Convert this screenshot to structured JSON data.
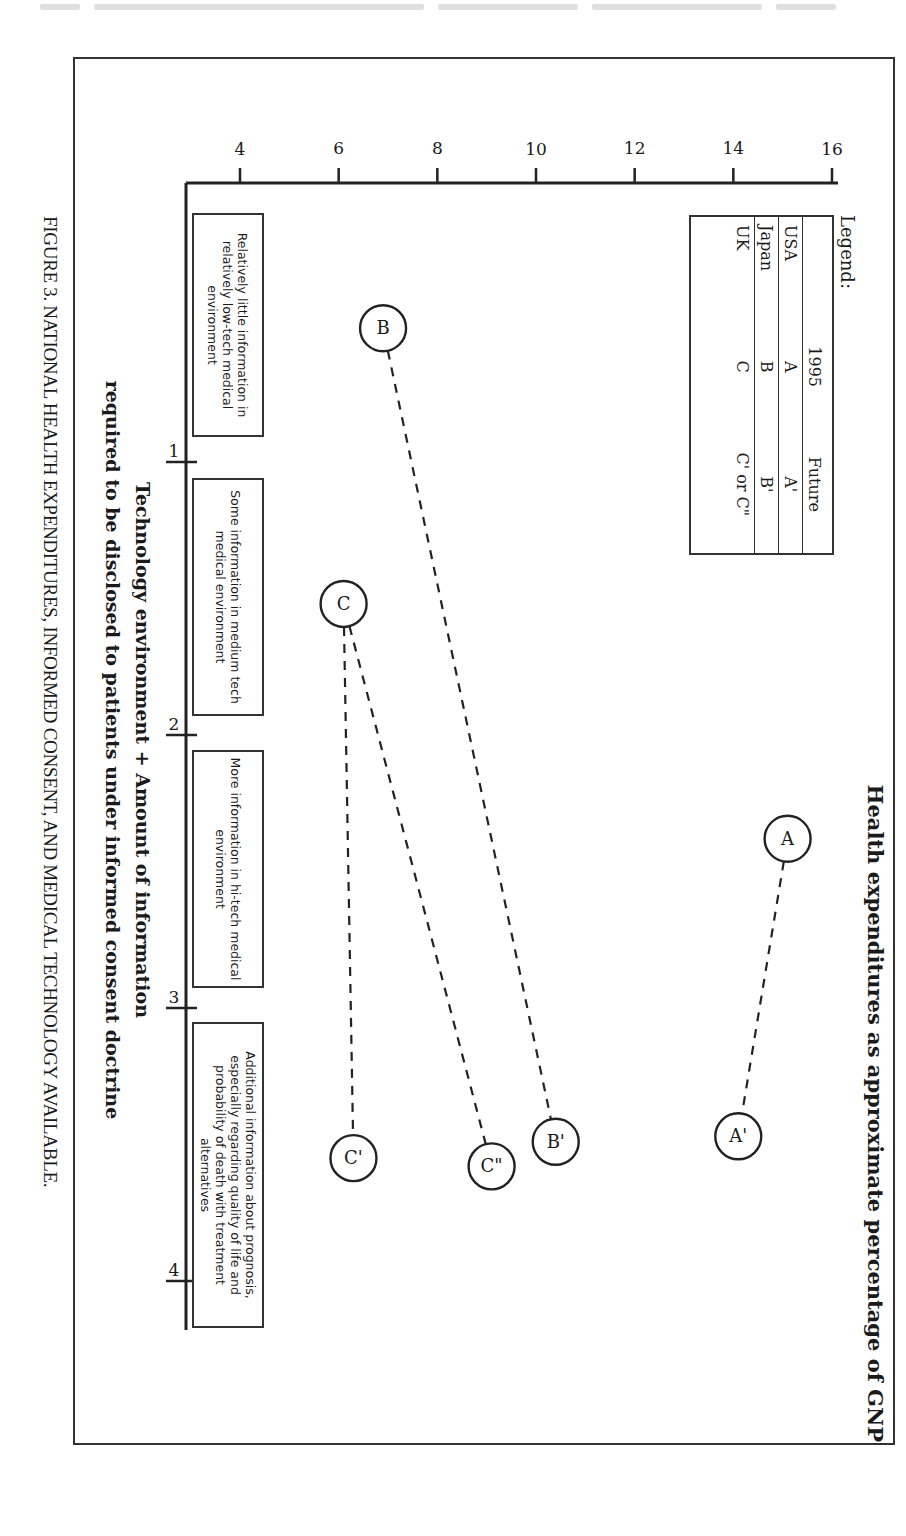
{
  "page": {
    "header_running_text": "(illegible running header, cut off at top of page)"
  },
  "figure": {
    "caption": "FIGURE 3. NATIONAL HEALTH EXPENDITURES, INFORMED CONSENT, AND MEDICAL TECHNOLOGY AVAILABLE.",
    "orientation": "rotated 90 degrees clockwise (landscape figure on portrait page)"
  },
  "chart_data": {
    "type": "scatter",
    "title": "",
    "ylabel": "Health expenditures as approximate percentage of GNP",
    "xlabel_line1": "Technology environment + Amount of information",
    "xlabel_line2": "required to be disclosed to patients under informed consent doctrine",
    "ylim": [
      4,
      16
    ],
    "yticks": [
      "4",
      "6",
      "8",
      "10",
      "12",
      "14",
      "16"
    ],
    "xlim": [
      0,
      4
    ],
    "xticks": [
      "1",
      "2",
      "3",
      "4"
    ],
    "grid": false,
    "legend_position": "upper-left",
    "legend": {
      "title": "Legend:",
      "columns": [
        "",
        "1995",
        "Future"
      ],
      "rows": [
        {
          "country": "USA",
          "y1995": "A",
          "future": "A'"
        },
        {
          "country": "Japan",
          "y1995": "B",
          "future": "B'"
        },
        {
          "country": "UK",
          "y1995": "C",
          "future": "C' or C\""
        }
      ]
    },
    "category_boxes": [
      {
        "x_range": [
          0,
          1
        ],
        "text": "Relatively little information in relatively low-tech medical environment"
      },
      {
        "x_range": [
          1,
          2
        ],
        "text": "Some information in medium tech medical environment"
      },
      {
        "x_range": [
          2,
          3
        ],
        "text": "More information in hi-tech medical environment"
      },
      {
        "x_range": [
          3,
          4
        ],
        "text": "Additional information about prognosis, especially regarding quality of life and probability of death with treatment alternatives"
      }
    ],
    "points": [
      {
        "label": "A",
        "country": "USA",
        "period": "1995",
        "x": 2.38,
        "y": 15.1
      },
      {
        "label": "A'",
        "country": "USA",
        "period": "Future",
        "x": 3.47,
        "y": 14.1
      },
      {
        "label": "B",
        "country": "Japan",
        "period": "1995",
        "x": 0.51,
        "y": 6.9
      },
      {
        "label": "B'",
        "country": "Japan",
        "period": "Future",
        "x": 3.49,
        "y": 10.4
      },
      {
        "label": "C",
        "country": "UK",
        "period": "1995",
        "x": 1.52,
        "y": 6.1
      },
      {
        "label": "C'",
        "country": "UK",
        "period": "Future",
        "x": 3.55,
        "y": 6.3
      },
      {
        "label": "C\"",
        "country": "UK",
        "period": "Future",
        "x": 3.58,
        "y": 9.1
      }
    ],
    "connections": [
      {
        "from": "A",
        "to": "A'",
        "style": "dashed"
      },
      {
        "from": "B",
        "to": "B'",
        "style": "dashed"
      },
      {
        "from": "C",
        "to": "C'",
        "style": "dashed"
      },
      {
        "from": "C",
        "to": "C\"",
        "style": "dashed"
      }
    ]
  },
  "labels": {
    "legend_title": "Legend:",
    "legend_col_1995": "1995",
    "legend_col_future": "Future",
    "legend_usa": "USA",
    "legend_usa_1995": "A",
    "legend_usa_future": "A'",
    "legend_japan": "Japan",
    "legend_japan_1995": "B",
    "legend_japan_future": "B'",
    "legend_uk": "UK",
    "legend_uk_1995": "C",
    "legend_uk_future": "C' or C\"",
    "box1": "Relatively little information in relatively low-tech medical environment",
    "box2": "Some information in medium tech medical environment",
    "box3": "More information in hi-tech medical environment",
    "box4": "Additional information about prognosis, especially regarding quality of life and probability of death with treatment alternatives"
  },
  "colors": {
    "ink": "#1a1a1a",
    "paper": "#ffffff",
    "frame": "#333333"
  }
}
